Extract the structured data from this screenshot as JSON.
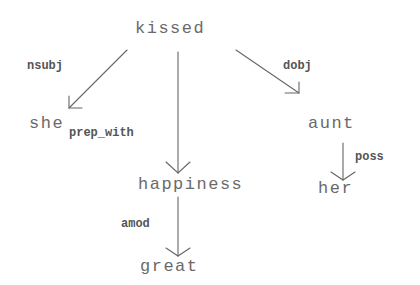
{
  "diagram": {
    "type": "dependency-parse-tree",
    "colors": {
      "background": "#ffffff",
      "node_text": "#6a6a6a",
      "edge_label": "#555555",
      "edge_line": "#666666"
    },
    "nodes": {
      "kissed": "kissed",
      "she": "she",
      "aunt": "aunt",
      "happiness": "happiness",
      "her": "her",
      "great": "great"
    },
    "edges": [
      {
        "from": "kissed",
        "to": "she",
        "label": "nsubj"
      },
      {
        "from": "kissed",
        "to": "happiness",
        "label": "prep_with"
      },
      {
        "from": "kissed",
        "to": "aunt",
        "label": "dobj"
      },
      {
        "from": "aunt",
        "to": "her",
        "label": "poss"
      },
      {
        "from": "happiness",
        "to": "great",
        "label": "amod"
      }
    ],
    "edge_labels": {
      "nsubj": "nsubj",
      "prep_with": "prep_with",
      "dobj": "dobj",
      "poss": "poss",
      "amod": "amod"
    }
  }
}
